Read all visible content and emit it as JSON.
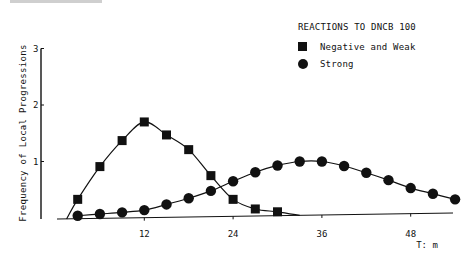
{
  "chart_data": {
    "type": "line",
    "title": "",
    "legend_title": "REACTIONS TO DNCB 100",
    "xlabel": "T: m",
    "ylabel": "Frequency of Local Progressions",
    "xlim": [
      0,
      55
    ],
    "ylim": [
      0,
      3
    ],
    "x_ticks": [
      12,
      24,
      36,
      48
    ],
    "y_ticks": [
      1,
      2,
      3
    ],
    "grid": false,
    "legend_position": "upper right",
    "series": [
      {
        "name": "Negative and Weak",
        "marker": "square",
        "x": [
          3,
          6,
          9,
          12,
          15,
          18,
          21,
          24,
          27,
          30
        ],
        "values": [
          0.33,
          0.91,
          1.37,
          1.7,
          1.47,
          1.21,
          0.75,
          0.33,
          0.16,
          0.11
        ]
      },
      {
        "name": "Strong",
        "marker": "circle",
        "x": [
          3,
          6,
          9,
          12,
          15,
          18,
          21,
          24,
          27,
          30,
          33,
          36,
          39,
          42,
          45,
          48,
          51,
          54
        ],
        "values": [
          0.04,
          0.07,
          0.1,
          0.14,
          0.24,
          0.35,
          0.48,
          0.65,
          0.81,
          0.93,
          1.0,
          1.0,
          0.92,
          0.8,
          0.67,
          0.53,
          0.43,
          0.33
        ]
      }
    ]
  },
  "legend": {
    "title": "REACTIONS TO DNCB 100",
    "items": [
      {
        "label": "Negative and Weak",
        "marker": "square"
      },
      {
        "label": "Strong",
        "marker": "circle"
      }
    ]
  },
  "axes": {
    "ylabel": "Frequency of Local Progressions",
    "xlabel": "T: m",
    "y_ticks": [
      "1",
      "2",
      "3"
    ],
    "x_ticks": [
      "12",
      "24",
      "36",
      "48"
    ]
  }
}
